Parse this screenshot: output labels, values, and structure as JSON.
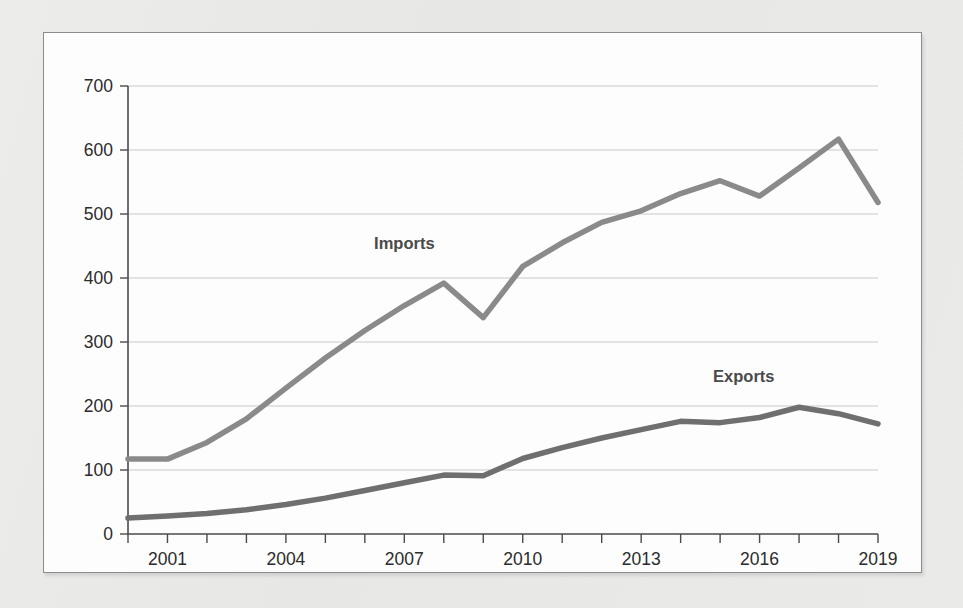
{
  "chart_data": {
    "type": "line",
    "title": "",
    "subtitle": "",
    "xlabel": "",
    "ylabel": "",
    "xlim": [
      2000,
      2019
    ],
    "ylim": [
      0,
      700
    ],
    "grid": true,
    "grid_axis": "y",
    "legend": "inline-annotations",
    "x": [
      2000,
      2001,
      2002,
      2003,
      2004,
      2005,
      2006,
      2007,
      2008,
      2009,
      2010,
      2011,
      2012,
      2013,
      2014,
      2015,
      2016,
      2017,
      2018,
      2019
    ],
    "x_tick_labels": [
      "2001",
      "2004",
      "2007",
      "2010",
      "2013",
      "2016",
      "2019"
    ],
    "x_tick_values": [
      2001,
      2004,
      2007,
      2010,
      2013,
      2016,
      2019
    ],
    "y_tick_labels": [
      "0",
      "100",
      "200",
      "300",
      "400",
      "500",
      "600",
      "700"
    ],
    "y_tick_values": [
      0,
      100,
      200,
      300,
      400,
      500,
      600,
      700
    ],
    "series": [
      {
        "name": "Imports",
        "color": "#8a8a8a",
        "stroke_width": 5.5,
        "label_x": 2007,
        "label_y": 455,
        "values": [
          117,
          117,
          143,
          180,
          228,
          275,
          318,
          357,
          392,
          338,
          418,
          455,
          487,
          505,
          532,
          552,
          528,
          572,
          617,
          518
        ]
      },
      {
        "name": "Exports",
        "color": "#6f6f6f",
        "stroke_width": 5.5,
        "label_x": 2015.6,
        "label_y": 247,
        "values": [
          25,
          28,
          32,
          38,
          46,
          56,
          68,
          80,
          92,
          91,
          118,
          135,
          150,
          163,
          176,
          174,
          182,
          198,
          188,
          172
        ]
      }
    ],
    "annotations": [
      {
        "text": "Imports",
        "x": 2007,
        "y": 455
      },
      {
        "text": "Exports",
        "x": 2015.6,
        "y": 247
      }
    ]
  },
  "colors": {
    "page_background": "#e9e9e7",
    "card_background": "#fdfdfd",
    "card_border": "#8c8c8c",
    "gridline": "#c9c9c9",
    "axis": "#4a4a4a",
    "tick_text": "#2b2b2b",
    "imports_line": "#8a8a8a",
    "exports_line": "#6f6f6f",
    "series_label_text": "#4a4a4a"
  }
}
